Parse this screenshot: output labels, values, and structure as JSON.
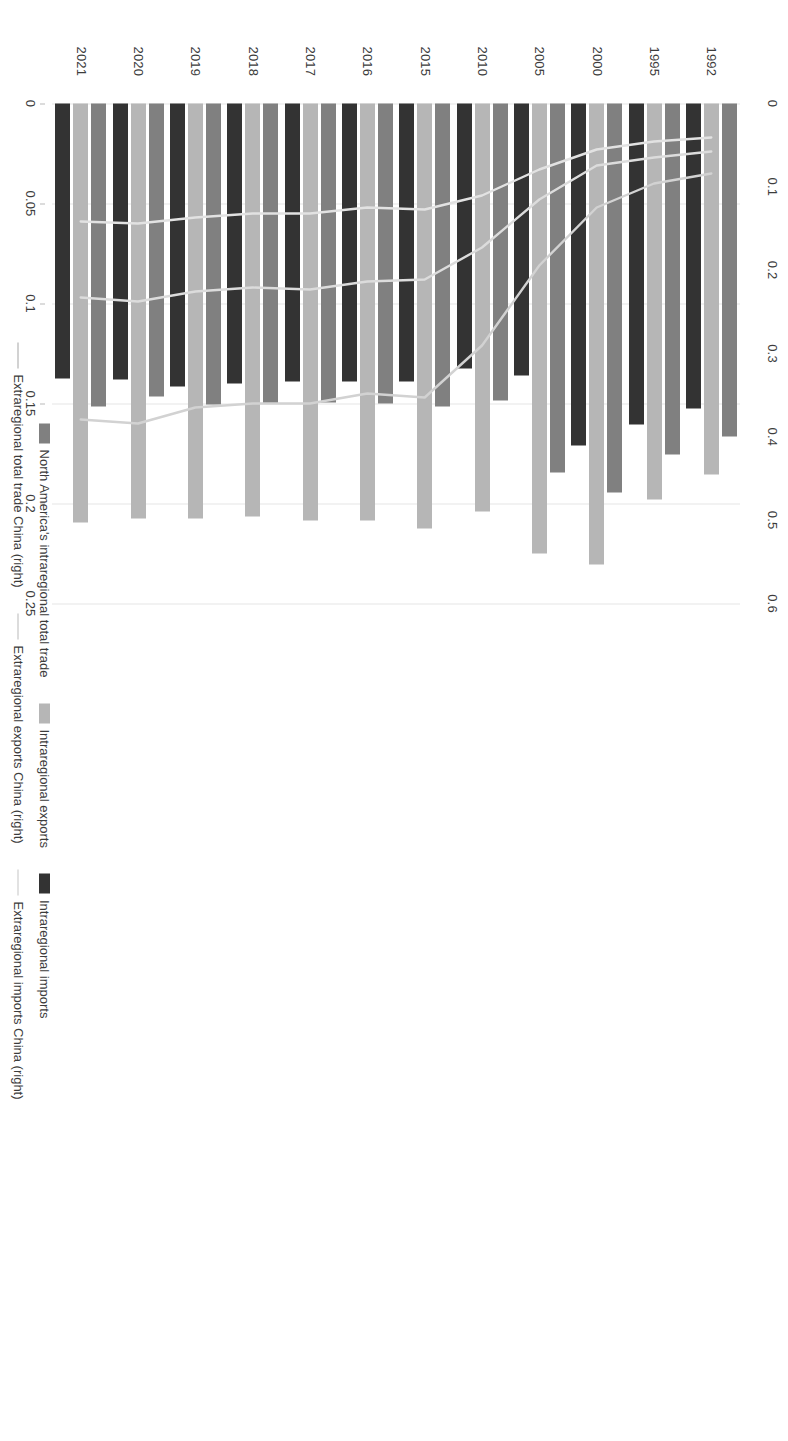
{
  "chart_data": {
    "type": "bar",
    "title": "",
    "subtitle": "",
    "xlabel": "",
    "ylabel": "",
    "orientation": "horizontal-rotated",
    "grid": true,
    "legend_position": "bottom",
    "categories": [
      "1992",
      "1995",
      "2000",
      "2005",
      "2010",
      "2015",
      "2016",
      "2017",
      "2018",
      "2019",
      "2020",
      "2021"
    ],
    "primary_axis": {
      "name": "left",
      "ticks": [
        "0",
        "0.1",
        "0.2",
        "0.3",
        "0.4",
        "0.5",
        "0.6"
      ],
      "tick_values": [
        0,
        0.1,
        0.2,
        0.3,
        0.4,
        0.5,
        0.6
      ],
      "range": [
        0,
        0.6
      ]
    },
    "secondary_axis": {
      "name": "right",
      "ticks": [
        "0",
        "0.05",
        "0.1",
        "0.15",
        "0.2",
        "0.25"
      ],
      "tick_values": [
        0,
        0.05,
        0.1,
        0.15,
        0.2,
        0.25
      ],
      "range": [
        0,
        0.25
      ]
    },
    "series": [
      {
        "name": "North America's intraregional total trade",
        "kind": "bar",
        "axis": "primary",
        "color": "#808080",
        "values": [
          0.399,
          0.421,
          0.467,
          0.443,
          0.356,
          0.363,
          0.36,
          0.359,
          0.36,
          0.361,
          0.351,
          0.363
        ]
      },
      {
        "name": "Intraregional exports",
        "kind": "bar",
        "axis": "primary",
        "color": "#b6b6b6",
        "values": [
          0.445,
          0.475,
          0.553,
          0.54,
          0.49,
          0.51,
          0.5,
          0.5,
          0.496,
          0.498,
          0.498,
          0.503
        ]
      },
      {
        "name": "Intraregional imports",
        "kind": "bar",
        "axis": "primary",
        "color": "#333333",
        "values": [
          0.366,
          0.385,
          0.41,
          0.326,
          0.318,
          0.334,
          0.333,
          0.334,
          0.336,
          0.339,
          0.331,
          0.33
        ]
      },
      {
        "name": "Extraregional total trade China (right)",
        "kind": "line",
        "axis": "secondary",
        "color": "#d2d2d2",
        "values": [
          0.035,
          0.04,
          0.052,
          0.081,
          0.121,
          0.147,
          0.145,
          0.15,
          0.15,
          0.152,
          0.16,
          0.158
        ]
      },
      {
        "name": "Extraregional exports China (right)",
        "kind": "line",
        "axis": "secondary",
        "color": "#dcdcdc",
        "values": [
          0.024,
          0.027,
          0.031,
          0.048,
          0.072,
          0.088,
          0.089,
          0.093,
          0.092,
          0.094,
          0.099,
          0.097
        ],
        "values_note": "middle trace"
      },
      {
        "name": "Extraregional imports China (right)",
        "kind": "line",
        "axis": "secondary",
        "color": "#e2e2e2",
        "values": [
          0.017,
          0.019,
          0.023,
          0.033,
          0.046,
          0.053,
          0.052,
          0.055,
          0.055,
          0.057,
          0.06,
          0.059
        ],
        "values_note": "leftmost trace"
      }
    ]
  },
  "legend": {
    "row1": [
      {
        "label": "North America's intraregional total trade",
        "swatch": "bar",
        "color_class": "c0"
      },
      {
        "label": "Intraregional exports",
        "swatch": "bar",
        "color_class": "c1"
      },
      {
        "label": "Intraregional imports",
        "swatch": "bar",
        "color_class": "c2"
      }
    ],
    "row2": [
      {
        "label": "Extraregional total trade China (right)",
        "swatch": "line",
        "color_class": "l1"
      },
      {
        "label": "Extraregional exports China (right)",
        "swatch": "line",
        "color_class": "l2"
      },
      {
        "label": "Extraregional imports China (right)",
        "swatch": "line",
        "color_class": "l3"
      }
    ]
  }
}
